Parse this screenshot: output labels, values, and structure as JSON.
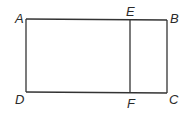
{
  "diagram": {
    "type": "rectangle-partition",
    "stroke_color": "#333333",
    "points": {
      "A": {
        "label": "A",
        "x": 26,
        "y": 19
      },
      "B": {
        "label": "B",
        "x": 167,
        "y": 20
      },
      "C": {
        "label": "C",
        "x": 167,
        "y": 93
      },
      "D": {
        "label": "D",
        "x": 26,
        "y": 92
      },
      "E": {
        "label": "E",
        "x": 130,
        "y": 20
      },
      "F": {
        "label": "F",
        "x": 130,
        "y": 93
      }
    },
    "segments": [
      "AB",
      "BC",
      "CD",
      "DA",
      "EF"
    ],
    "labels": {
      "A": "A",
      "B": "B",
      "C": "C",
      "D": "D",
      "E": "E",
      "F": "F"
    }
  }
}
